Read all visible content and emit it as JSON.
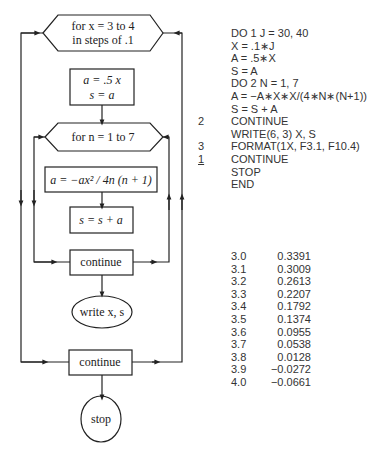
{
  "flowchart": {
    "outer_loop": {
      "line1": "for x = 3 to 4",
      "line2": "in steps of .1"
    },
    "init_box": {
      "line1": "a = .5 x",
      "line2": "s = a"
    },
    "inner_loop": "for n = 1 to 7",
    "update_a": "a = −ax² / 4n (n + 1)",
    "update_s": "s = s + a",
    "inner_continue": "continue",
    "write": "write x, s",
    "outer_continue": "continue",
    "stop": "stop"
  },
  "program": {
    "lines": [
      {
        "label": "",
        "code": "DO 1 J = 30, 40"
      },
      {
        "label": "",
        "code": "X = .1∗J"
      },
      {
        "label": "",
        "code": "A = .5∗X"
      },
      {
        "label": "",
        "code": "S = A"
      },
      {
        "label": "",
        "code": "DO 2 N = 1, 7"
      },
      {
        "label": "",
        "code": "A = −A∗X∗X/(4∗N∗(N+1))"
      },
      {
        "label": "",
        "code": "S = S + A"
      },
      {
        "label": "2",
        "code": "CONTINUE"
      },
      {
        "label": "",
        "code": "WRITE(6, 3) X, S"
      },
      {
        "label": "3",
        "code": "FORMAT(1X, F3.1, F10.4)"
      },
      {
        "label": "1",
        "code": "CONTINUE"
      },
      {
        "label": "",
        "code": "STOP"
      },
      {
        "label": "",
        "code": "END"
      }
    ]
  },
  "output": {
    "rows": [
      {
        "x": "3.0",
        "s": "0.3391"
      },
      {
        "x": "3.1",
        "s": "0.3009"
      },
      {
        "x": "3.2",
        "s": "0.2613"
      },
      {
        "x": "3.3",
        "s": "0.2207"
      },
      {
        "x": "3.4",
        "s": "0.1792"
      },
      {
        "x": "3.5",
        "s": "0.1374"
      },
      {
        "x": "3.6",
        "s": "0.0955"
      },
      {
        "x": "3.7",
        "s": "0.0538"
      },
      {
        "x": "3.8",
        "s": "0.0128"
      },
      {
        "x": "3.9",
        "s": "−0.0272"
      },
      {
        "x": "4.0",
        "s": "−0.0661"
      }
    ]
  }
}
